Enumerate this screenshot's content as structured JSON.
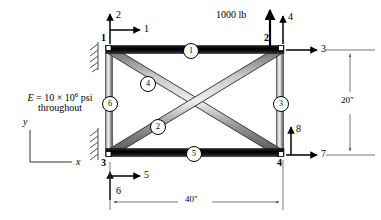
{
  "figure": {
    "material": {
      "line1_prefix": "E = 10 ",
      "line1_times": "×",
      "line1_base": " 10",
      "line1_exp": "6",
      "line1_unit": " psi",
      "line2": "throughout"
    },
    "load": {
      "magnitude": "1000 lb",
      "direction": "up",
      "applied_at_node": "2"
    },
    "coordinate_axes": {
      "y_label": "y",
      "x_label": "x"
    },
    "dimensions": [
      {
        "name": "span",
        "value": "40\"",
        "orientation": "horizontal"
      },
      {
        "name": "height",
        "value": "20\"",
        "orientation": "vertical"
      }
    ],
    "nodes": [
      {
        "label": "1",
        "position": "top-left",
        "support": "fixed"
      },
      {
        "label": "2",
        "position": "top-right",
        "support": "free"
      },
      {
        "label": "3",
        "position": "bottom-left",
        "support": "fixed"
      },
      {
        "label": "4",
        "position": "bottom-right",
        "support": "free"
      }
    ],
    "dofs": [
      {
        "label": "1",
        "node": "1",
        "direction": "x"
      },
      {
        "label": "2",
        "node": "1",
        "direction": "y"
      },
      {
        "label": "3",
        "node": "2",
        "direction": "x"
      },
      {
        "label": "4",
        "node": "2",
        "direction": "y"
      },
      {
        "label": "5",
        "node": "3",
        "direction": "x"
      },
      {
        "label": "6",
        "node": "3",
        "direction": "y"
      },
      {
        "label": "7",
        "node": "4",
        "direction": "x"
      },
      {
        "label": "8",
        "node": "4",
        "direction": "y"
      }
    ],
    "elements": [
      {
        "label": "1",
        "description": "top-chord",
        "style": "black"
      },
      {
        "label": "2",
        "description": "diagonal-lower-left-to-upper-right",
        "style": "gray"
      },
      {
        "label": "3",
        "description": "right-vertical",
        "style": "gray"
      },
      {
        "label": "4",
        "description": "diagonal-upper-left-to-lower-right",
        "style": "gray"
      },
      {
        "label": "5",
        "description": "bottom-chord",
        "style": "black"
      },
      {
        "label": "6",
        "description": "left-vertical",
        "style": "gray"
      }
    ]
  }
}
